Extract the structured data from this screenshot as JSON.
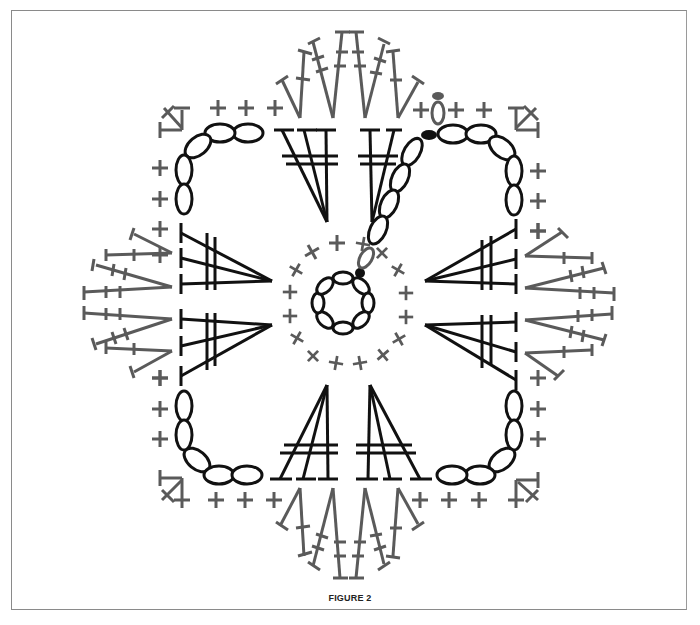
{
  "figure": {
    "caption": "FIGURE 2",
    "type": "crochet-chart"
  },
  "colors": {
    "round_dark": "#111111",
    "round_gray": "#5a5a5a",
    "frame": "#8a8a8a",
    "background": "#ffffff"
  },
  "legend_symbols": {
    "chain": "oval",
    "slip_stitch": "filled-dot",
    "single_crochet": "plus/cross",
    "treble_crochet": "T with two cross-bars"
  },
  "rounds": [
    {
      "round": 1,
      "color": "dark",
      "stitches": "8 chains joined in ring"
    },
    {
      "round": 2,
      "color": "gray",
      "stitches": "16 single crochet"
    },
    {
      "round": 3,
      "color": "dark",
      "stitches": "8 treble clusters (3-tr fans), corner chain loops of 7 ch"
    },
    {
      "round": 4,
      "color": "gray",
      "stitches": "single crochet along sides, corner sc, petal fans of tall stitches"
    }
  ]
}
